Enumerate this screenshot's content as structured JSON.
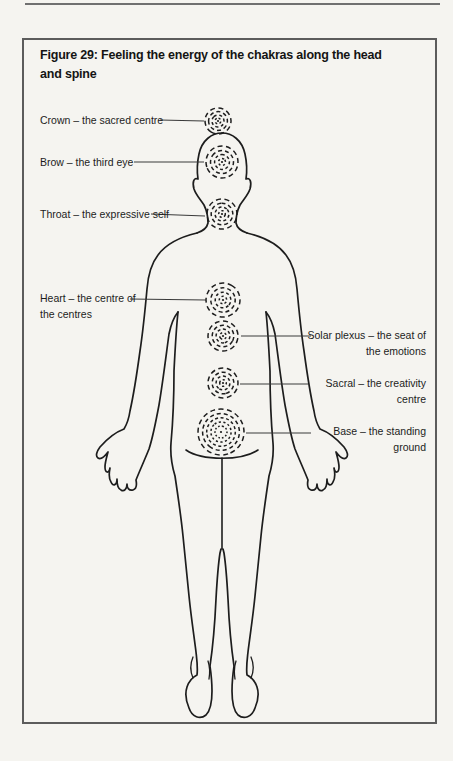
{
  "figure": {
    "title_line1": "Figure 29: Feeling the energy of the chakras along the head",
    "title_line2": "and spine"
  },
  "labels": {
    "crown": {
      "text": "Crown – the sacred centre"
    },
    "brow": {
      "text": "Brow – the third eye"
    },
    "throat": {
      "text": "Throat – the expressive self"
    },
    "heart": {
      "line1": "Heart – the centre of",
      "line2": "the centres"
    },
    "solar_plexus": {
      "line1": "Solar plexus – the seat of",
      "line2": "the emotions"
    },
    "sacral": {
      "line1": "Sacral – the creativity",
      "line2": "centre"
    },
    "base": {
      "line1": "Base – the standing",
      "line2": "ground"
    }
  },
  "colors": {
    "background": "#f5f4f0",
    "ink": "#1d1d1d",
    "box_border": "#5c5c5c",
    "top_rule": "#707070",
    "leader_line": "#3a3a3a"
  }
}
